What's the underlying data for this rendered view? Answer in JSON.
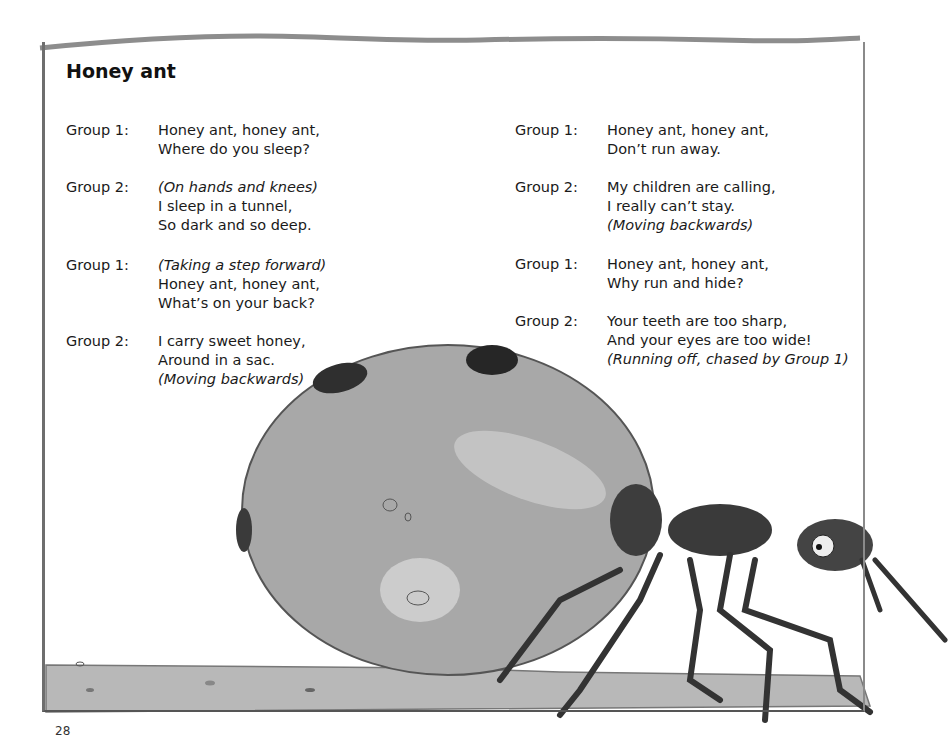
{
  "page": {
    "title": "Honey ant",
    "page_number": "28"
  },
  "left_column": [
    {
      "speaker": "Group 1:",
      "lines": [
        {
          "text": "Honey ant, honey ant,",
          "italic": false
        },
        {
          "text": "Where do you sleep?",
          "italic": false
        }
      ]
    },
    {
      "speaker": "Group 2:",
      "lines": [
        {
          "text": "(On hands and knees)",
          "italic": true
        },
        {
          "text": "I sleep in a tunnel,",
          "italic": false
        },
        {
          "text": "So dark and so deep.",
          "italic": false
        }
      ]
    },
    {
      "speaker": "Group 1:",
      "lines": [
        {
          "text": "(Taking a step forward)",
          "italic": true
        },
        {
          "text": "Honey ant, honey ant,",
          "italic": false
        },
        {
          "text": "What’s on your back?",
          "italic": false
        }
      ]
    },
    {
      "speaker": "Group 2:",
      "lines": [
        {
          "text": "I carry sweet honey,",
          "italic": false
        },
        {
          "text": "Around in a sac.",
          "italic": false
        },
        {
          "text": "(Moving backwards)",
          "italic": true
        }
      ]
    }
  ],
  "right_column": [
    {
      "speaker": "Group 1:",
      "lines": [
        {
          "text": "Honey ant, honey ant,",
          "italic": false
        },
        {
          "text": "Don’t run away.",
          "italic": false
        }
      ]
    },
    {
      "speaker": "Group 2:",
      "lines": [
        {
          "text": "My children are calling,",
          "italic": false
        },
        {
          "text": "I really can’t stay.",
          "italic": false
        },
        {
          "text": "(Moving backwards)",
          "italic": true
        }
      ]
    },
    {
      "speaker": "Group 1:",
      "lines": [
        {
          "text": "Honey ant, honey ant,",
          "italic": false
        },
        {
          "text": "Why run and hide?",
          "italic": false
        }
      ]
    },
    {
      "speaker": "Group 2:",
      "lines": [
        {
          "text": "Your teeth are too sharp,",
          "italic": false
        },
        {
          "text": "And your eyes are too wide!",
          "italic": false
        },
        {
          "text": "(Running off, chased by Group 1)",
          "italic": true
        }
      ]
    }
  ],
  "illustration": {
    "subject": "honey-ant-with-swollen-abdomen",
    "colors": {
      "ground": "#b5b5b5",
      "sac": "#a9a9a9",
      "ant": "#3d3d3d",
      "border": "#6e6e6e"
    }
  }
}
